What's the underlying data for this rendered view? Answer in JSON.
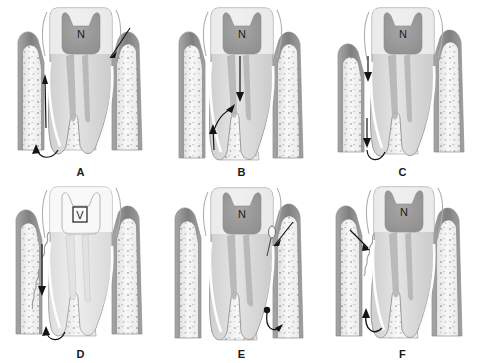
{
  "figure": {
    "background_color": "#ffffff",
    "panel_count": 6,
    "grid": "2 rows x 3 columns"
  },
  "palette": {
    "enamel": "#f2f2f2",
    "dentin": "#d8d8d8",
    "pulp_chamber": "#9a9a9a",
    "pulp_canal": "#b5b5b5",
    "gingiva": "#8e8e8e",
    "gingiva_light": "#bdbdbd",
    "bone": "#cfcfcf",
    "bone_marrow": "#f6f6f6",
    "trabeculae": "#6f6f6f",
    "pdl_space": "#fbfbfb",
    "outline": "#7d7d7d",
    "arrow": "#141414",
    "label_text": "#1a1a1a"
  },
  "panels": [
    {
      "id": "A",
      "label": "A",
      "pulp_label": "N",
      "pulp_label_boxed": false,
      "arrows": [
        {
          "name": "sulcus-entry-arrow",
          "direction": "down-left",
          "location": "distal gingival sulcus"
        },
        {
          "name": "lesion-ascending-arrow",
          "direction": "up",
          "location": "mesial periodontal ligament space"
        },
        {
          "name": "apical-turn-arrow",
          "direction": "down-around-apex",
          "location": "mesial root apex"
        }
      ]
    },
    {
      "id": "B",
      "label": "B",
      "pulp_label": "N",
      "pulp_label_boxed": false,
      "arrows": [
        {
          "name": "pulp-descending-arrow",
          "direction": "down",
          "location": "pulp canal toward furcation"
        },
        {
          "name": "furcation-exit-arrow",
          "direction": "up-left",
          "location": "furcation region"
        },
        {
          "name": "pdl-ascending-arrow",
          "direction": "up",
          "location": "mesial periodontal ligament space"
        }
      ]
    },
    {
      "id": "C",
      "label": "C",
      "pulp_label": "N",
      "pulp_label_boxed": false,
      "arrows": [
        {
          "name": "sulcus-descending-arrow",
          "direction": "down",
          "location": "mesial gingival sulcus"
        },
        {
          "name": "apical-descending-arrow",
          "direction": "down-around-apex",
          "location": "mesial root apex"
        }
      ]
    },
    {
      "id": "D",
      "label": "D",
      "pulp_label": "V",
      "pulp_label_boxed": true,
      "features": [
        "calculus-deposit-wavy-line"
      ],
      "arrows": [
        {
          "name": "pocket-descending-arrow",
          "direction": "down",
          "location": "mesial periodontal pocket"
        },
        {
          "name": "apical-turn-arrow",
          "direction": "down-around-apex",
          "location": "mesial root apex"
        }
      ]
    },
    {
      "id": "E",
      "label": "E",
      "pulp_label": "N",
      "pulp_label_boxed": false,
      "features": [
        "lateral-canal-marker"
      ],
      "arrows": [
        {
          "name": "sulcus-entry-arrow",
          "direction": "down-left",
          "location": "distal gingival sulcus"
        },
        {
          "name": "distal-apical-arrow",
          "direction": "down-around-apex",
          "location": "distal root apex"
        }
      ]
    },
    {
      "id": "F",
      "label": "F",
      "pulp_label": "N",
      "pulp_label_boxed": false,
      "features": [
        "calculus-deposit-wavy-line"
      ],
      "arrows": [
        {
          "name": "sulcus-entry-arrow",
          "direction": "down-right",
          "location": "mesial gingival sulcus"
        },
        {
          "name": "apical-turn-arrow",
          "direction": "up-around-apex",
          "location": "mesial root apex"
        }
      ]
    }
  ]
}
